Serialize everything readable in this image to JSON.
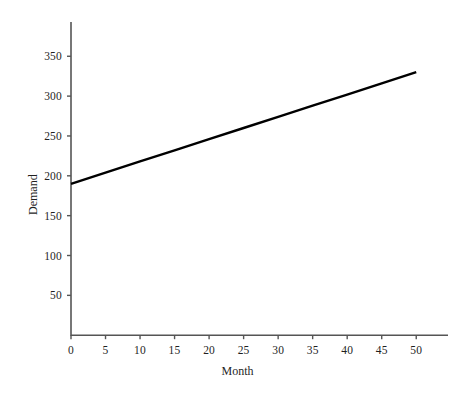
{
  "chart_data": {
    "type": "line",
    "title": "",
    "xlabel": "Month",
    "ylabel": "Demand",
    "xlim": [
      0,
      54.6
    ],
    "ylim": [
      0,
      393
    ],
    "xticks": [
      0,
      5,
      10,
      15,
      20,
      25,
      30,
      35,
      40,
      45,
      50
    ],
    "yticks": [
      50,
      100,
      150,
      200,
      250,
      300,
      350
    ],
    "xtick_labels": [
      "0",
      "5",
      "10",
      "15",
      "20",
      "25",
      "30",
      "35",
      "40",
      "45",
      "50"
    ],
    "ytick_labels": [
      "50",
      "100",
      "150",
      "200",
      "250",
      "300",
      "350"
    ],
    "grid": false,
    "legend": false,
    "series": [
      {
        "name": "Demand",
        "color": "#000000",
        "line_width": 2.4,
        "x": [
          0,
          5,
          10,
          15,
          20,
          25,
          30,
          35,
          40,
          45,
          50
        ],
        "values": [
          190,
          204,
          218,
          232,
          246,
          260,
          274,
          288,
          302,
          316,
          330
        ]
      }
    ]
  },
  "axes": {
    "line_color": "#555555",
    "tick_color": "#555555"
  }
}
